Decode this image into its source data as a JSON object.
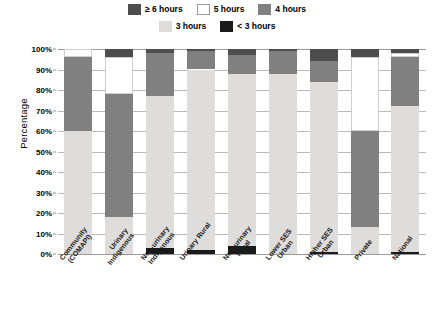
{
  "chart_data": {
    "type": "bar",
    "subtype": "stacked-bar-100",
    "title": "",
    "xlabel": "",
    "ylabel": "Percentage",
    "ylim": [
      0,
      100
    ],
    "ytick_labels": [
      "0%",
      "10%",
      "20%",
      "30%",
      "40%",
      "50%",
      "60%",
      "70%",
      "80%",
      "90%",
      "100%"
    ],
    "ytick_values": [
      0,
      10,
      20,
      30,
      40,
      50,
      60,
      70,
      80,
      90,
      100
    ],
    "grid": true,
    "legend_position": "top",
    "categories": [
      "Community (COMAPI)",
      "Urinary Indigenous",
      "Non-urinary Indigenous",
      "Urinary Rural",
      "Non-urinary Rural",
      "Lower SES Urban",
      "Higher SES Urban",
      "Private",
      "National"
    ],
    "category_lines": [
      [
        "Community",
        "(COMAPI)"
      ],
      [
        "Urinary",
        "Indigenous"
      ],
      [
        "Non-urinary",
        "Indigenous"
      ],
      [
        "Urinary Rural"
      ],
      [
        "Non-urinary",
        "Rural"
      ],
      [
        "Lower SES",
        "Urban"
      ],
      [
        "Higher SES",
        "Urban"
      ],
      [
        "Private"
      ],
      [
        "National"
      ]
    ],
    "series": [
      {
        "name": "< 3 hours",
        "color": "#1a1a1a",
        "values": [
          0,
          0,
          3,
          2,
          4,
          0,
          1,
          0,
          1
        ]
      },
      {
        "name": "3 hours",
        "color": "#dedddb",
        "values": [
          60,
          18,
          74,
          88,
          84,
          88,
          83,
          13,
          71
        ]
      },
      {
        "name": "4 hours",
        "color": "#808080",
        "values": [
          36,
          60,
          21,
          9,
          9,
          11,
          10,
          47,
          24
        ]
      },
      {
        "name": "5 hours",
        "color": "#ffffff",
        "values": [
          4,
          18,
          0,
          0,
          0,
          0,
          0,
          36,
          2
        ]
      },
      {
        "name": "≥ 6 hours",
        "color": "#4d4d4d",
        "values": [
          0,
          4,
          2,
          1,
          3,
          1,
          6,
          4,
          2
        ]
      }
    ],
    "stack_order_bottom_to_top": [
      "< 3 hours",
      "3 hours",
      "4 hours",
      "5 hours",
      "≥ 6 hours"
    ]
  },
  "legend": {
    "row1": [
      {
        "label": "≥ 6 hours",
        "color": "#4d4d4d",
        "border": "none"
      },
      {
        "label": "5 hours",
        "color": "#ffffff",
        "border": "1px solid #9a9a9a"
      },
      {
        "label": "4 hours",
        "color": "#808080",
        "border": "none"
      }
    ],
    "row2": [
      {
        "label": "3 hours",
        "color": "#dedddb",
        "border": "none"
      },
      {
        "label": "< 3 hours",
        "color": "#1a1a1a",
        "border": "none"
      }
    ]
  },
  "axis": {
    "y_title": "Percentage"
  }
}
